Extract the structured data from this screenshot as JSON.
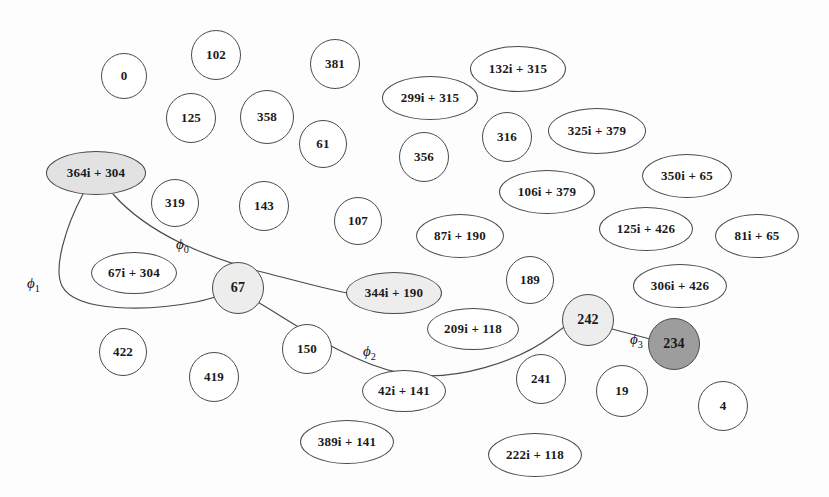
{
  "figure": {
    "kind": "isogeny-graph",
    "width": 829,
    "height": 497,
    "background": "#fdfdfd",
    "stroke": "#4a4a4a"
  },
  "palette": {
    "node_fill_default": "#ffffff",
    "node_fill_light": "#ededed",
    "node_fill_mid": "#e2e2e2",
    "node_fill_dark": "#9d9d9d",
    "node_stroke": "#4a4a4a",
    "edge_stroke": "#4a4a4a",
    "text": "#1a1a1a"
  },
  "nodes": [
    {
      "id": "n0",
      "label": "0",
      "x": 124,
      "y": 76,
      "rx": 23,
      "ry": 23,
      "shade": "none",
      "font": 13
    },
    {
      "id": "n102",
      "label": "102",
      "x": 216,
      "y": 55,
      "rx": 25,
      "ry": 25,
      "shade": "none",
      "font": 13
    },
    {
      "id": "n381",
      "label": "381",
      "x": 335,
      "y": 64,
      "rx": 25,
      "ry": 25,
      "shade": "none",
      "font": 13
    },
    {
      "id": "n132",
      "label": "132i + 315",
      "x": 518,
      "y": 69,
      "rx": 48,
      "ry": 23,
      "shade": "none",
      "font": 13
    },
    {
      "id": "n299",
      "label": "299i + 315",
      "x": 430,
      "y": 98,
      "rx": 48,
      "ry": 22,
      "shade": "none",
      "font": 13
    },
    {
      "id": "n125a",
      "label": "125",
      "x": 191,
      "y": 118,
      "rx": 25,
      "ry": 25,
      "shade": "none",
      "font": 13
    },
    {
      "id": "n358",
      "label": "358",
      "x": 267,
      "y": 117,
      "rx": 27,
      "ry": 27,
      "shade": "none",
      "font": 13
    },
    {
      "id": "n61",
      "label": "61",
      "x": 323,
      "y": 144,
      "rx": 24,
      "ry": 24,
      "shade": "none",
      "font": 13
    },
    {
      "id": "n316",
      "label": "316",
      "x": 507,
      "y": 137,
      "rx": 25,
      "ry": 25,
      "shade": "none",
      "font": 13
    },
    {
      "id": "n325",
      "label": "325i + 379",
      "x": 597,
      "y": 131,
      "rx": 49,
      "ry": 23,
      "shade": "none",
      "font": 13
    },
    {
      "id": "n356",
      "label": "356",
      "x": 424,
      "y": 157,
      "rx": 25,
      "ry": 25,
      "shade": "none",
      "font": 13
    },
    {
      "id": "n364",
      "label": "364i + 304",
      "x": 96,
      "y": 173,
      "rx": 50,
      "ry": 22,
      "shade": "mid",
      "font": 13
    },
    {
      "id": "n350",
      "label": "350i + 65",
      "x": 687,
      "y": 176,
      "rx": 45,
      "ry": 22,
      "shade": "none",
      "font": 13
    },
    {
      "id": "n106",
      "label": "106i + 379",
      "x": 547,
      "y": 192,
      "rx": 48,
      "ry": 22,
      "shade": "none",
      "font": 13
    },
    {
      "id": "n319",
      "label": "319",
      "x": 175,
      "y": 203,
      "rx": 24,
      "ry": 24,
      "shade": "none",
      "font": 13
    },
    {
      "id": "n143",
      "label": "143",
      "x": 264,
      "y": 206,
      "rx": 25,
      "ry": 25,
      "shade": "none",
      "font": 13
    },
    {
      "id": "n107",
      "label": "107",
      "x": 358,
      "y": 221,
      "rx": 24,
      "ry": 24,
      "shade": "none",
      "font": 13
    },
    {
      "id": "n87",
      "label": "87i + 190",
      "x": 460,
      "y": 236,
      "rx": 44,
      "ry": 22,
      "shade": "none",
      "font": 13
    },
    {
      "id": "n125b",
      "label": "125i + 426",
      "x": 646,
      "y": 229,
      "rx": 47,
      "ry": 22,
      "shade": "none",
      "font": 13
    },
    {
      "id": "n81",
      "label": "81i + 65",
      "x": 757,
      "y": 236,
      "rx": 42,
      "ry": 22,
      "shade": "none",
      "font": 13
    },
    {
      "id": "n67i",
      "label": "67i + 304",
      "x": 134,
      "y": 273,
      "rx": 43,
      "ry": 21,
      "shade": "none",
      "font": 13
    },
    {
      "id": "n189",
      "label": "189",
      "x": 530,
      "y": 280,
      "rx": 24,
      "ry": 24,
      "shade": "none",
      "font": 13
    },
    {
      "id": "n306",
      "label": "306i + 426",
      "x": 680,
      "y": 286,
      "rx": 47,
      "ry": 22,
      "shade": "none",
      "font": 13
    },
    {
      "id": "n67",
      "label": "67",
      "x": 238,
      "y": 288,
      "rx": 26,
      "ry": 26,
      "shade": "light",
      "font": 14
    },
    {
      "id": "n344",
      "label": "344i + 190",
      "x": 394,
      "y": 293,
      "rx": 48,
      "ry": 21,
      "shade": "light",
      "font": 13
    },
    {
      "id": "n209",
      "label": "209i + 118",
      "x": 473,
      "y": 329,
      "rx": 46,
      "ry": 21,
      "shade": "none",
      "font": 13
    },
    {
      "id": "n242",
      "label": "242",
      "x": 588,
      "y": 320,
      "rx": 26,
      "ry": 26,
      "shade": "light",
      "font": 14
    },
    {
      "id": "n234",
      "label": "234",
      "x": 674,
      "y": 344,
      "rx": 26,
      "ry": 26,
      "shade": "dark",
      "font": 14
    },
    {
      "id": "n422",
      "label": "422",
      "x": 123,
      "y": 352,
      "rx": 24,
      "ry": 24,
      "shade": "none",
      "font": 13
    },
    {
      "id": "n150",
      "label": "150",
      "x": 307,
      "y": 349,
      "rx": 25,
      "ry": 25,
      "shade": "none",
      "font": 13
    },
    {
      "id": "n419",
      "label": "419",
      "x": 214,
      "y": 377,
      "rx": 25,
      "ry": 25,
      "shade": "none",
      "font": 13
    },
    {
      "id": "n241",
      "label": "241",
      "x": 541,
      "y": 379,
      "rx": 25,
      "ry": 25,
      "shade": "none",
      "font": 13
    },
    {
      "id": "n19",
      "label": "19",
      "x": 622,
      "y": 391,
      "rx": 26,
      "ry": 26,
      "shade": "none",
      "font": 13
    },
    {
      "id": "n4",
      "label": "4",
      "x": 723,
      "y": 406,
      "rx": 25,
      "ry": 25,
      "shade": "none",
      "font": 13
    },
    {
      "id": "n42",
      "label": "42i + 141",
      "x": 404,
      "y": 391,
      "rx": 42,
      "ry": 21,
      "shade": "none",
      "font": 13
    },
    {
      "id": "n389",
      "label": "389i + 141",
      "x": 347,
      "y": 442,
      "rx": 47,
      "ry": 22,
      "shade": "none",
      "font": 13
    },
    {
      "id": "n222",
      "label": "222i + 118",
      "x": 535,
      "y": 455,
      "rx": 47,
      "ry": 22,
      "shade": "none",
      "font": 13
    }
  ],
  "edges": [
    {
      "id": "e0",
      "label": "ϕ",
      "sub": "0",
      "from": "n364",
      "to": "n344",
      "label_x": 176,
      "label_y": 236,
      "path": "M 113 194 C 150 236, 210 258, 262 272 C 305 283, 330 290, 347 293"
    },
    {
      "id": "e1",
      "label": "ϕ",
      "sub": "1",
      "from": "n364",
      "to": "n67",
      "label_x": 27,
      "label_y": 275,
      "path": "M 83 194 C 66 226, 53 268, 62 286 C 76 313, 150 311, 196 302 C 210 299, 219 296, 226 293"
    },
    {
      "id": "e2",
      "label": "ϕ",
      "sub": "2",
      "from": "n67",
      "to": "n242",
      "label_x": 363,
      "label_y": 343,
      "path": "M 256 301 C 300 327, 348 362, 400 373 C 455 384, 520 360, 552 336 C 560 330, 564 327, 567 325"
    },
    {
      "id": "e3",
      "label": "ϕ",
      "sub": "3",
      "from": "n242",
      "to": "n234",
      "label_x": 630,
      "label_y": 331,
      "path": "M 612 329 L 650 339"
    }
  ]
}
